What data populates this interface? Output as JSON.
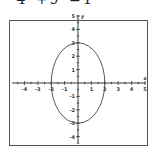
{
  "equation": {
    "term1_denominator": "4",
    "plus": "+",
    "term2_denominator": "9",
    "equals": "=",
    "rhs": "1",
    "full_text": "x²/4 + y²/9 = 1"
  },
  "chart_data": {
    "type": "line",
    "xlabel": "x",
    "ylabel": "y",
    "xlim": [
      -5,
      5
    ],
    "ylim": [
      -5,
      5
    ],
    "x_ticks": [
      -4,
      -3,
      -2,
      -1,
      1,
      2,
      3,
      4,
      5
    ],
    "y_ticks": [
      -4,
      -3,
      -2,
      -1,
      1,
      2,
      3,
      4,
      5
    ],
    "grid": false,
    "legend": "none",
    "series": [
      {
        "name": "ellipse",
        "shape": "ellipse",
        "center": [
          0,
          0
        ],
        "semi_axis_x": 2,
        "semi_axis_y": 3,
        "key_points": [
          [
            2,
            0
          ],
          [
            0,
            3
          ],
          [
            -2,
            0
          ],
          [
            0,
            -3
          ]
        ]
      }
    ]
  },
  "colors": {
    "curve": "#444444",
    "axis": "#222222",
    "frame": "#555555"
  }
}
